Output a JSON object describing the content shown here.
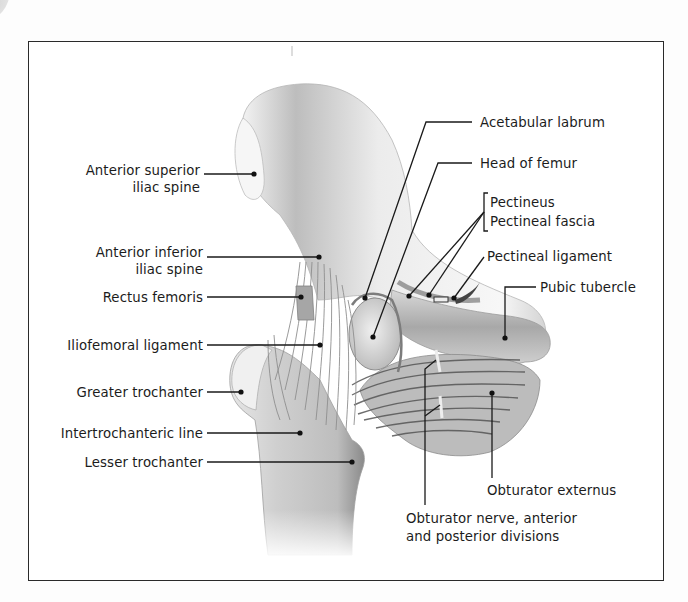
{
  "diagram": {
    "frame": {
      "x": 28,
      "y": 41,
      "width": 636,
      "height": 540
    },
    "colors": {
      "frame": "#2a2a2a",
      "text": "#1c1c1c",
      "leader": "#1a1a1a",
      "bone_light": "#f2f2f2",
      "bone_mid": "#c9c9c9",
      "bone_dark": "#8e8e8e",
      "ligament": "#a9a9a9",
      "muscle": "#7d7d7d"
    },
    "labels_left": [
      {
        "id": "anterior-superior-iliac-spine",
        "lines": [
          "Anterior superior",
          "iliac spine"
        ],
        "x_right": 200,
        "y": 162,
        "point": [
          254,
          174
        ]
      },
      {
        "id": "anterior-inferior-iliac-spine",
        "lines": [
          "Anterior inferior",
          "iliac spine"
        ],
        "x_right": 203,
        "y": 244,
        "point": [
          319,
          257
        ]
      },
      {
        "id": "rectus-femoris",
        "lines": [
          "Rectus femoris"
        ],
        "x_right": 203,
        "y": 289,
        "point": [
          301,
          297
        ]
      },
      {
        "id": "iliofemoral-ligament",
        "lines": [
          "Iliofemoral ligament"
        ],
        "x_right": 203,
        "y": 337,
        "point": [
          320,
          345
        ]
      },
      {
        "id": "greater-trochanter",
        "lines": [
          "Greater trochanter"
        ],
        "x_right": 203,
        "y": 384,
        "point": [
          241,
          392
        ]
      },
      {
        "id": "intertrochanteric-line",
        "lines": [
          "Intertrochanteric line"
        ],
        "x_right": 203,
        "y": 425,
        "point": [
          300,
          433
        ]
      },
      {
        "id": "lesser-trochanter",
        "lines": [
          "Lesser trochanter"
        ],
        "x_right": 203,
        "y": 454,
        "point": [
          352,
          462
        ]
      }
    ],
    "labels_right": [
      {
        "id": "acetabular-labrum",
        "lines": [
          "Acetabular labrum"
        ],
        "x": 480,
        "y": 114
      },
      {
        "id": "head-of-femur",
        "lines": [
          "Head of femur"
        ],
        "x": 480,
        "y": 155
      },
      {
        "id": "pectineus-group",
        "lines": [
          "Pectineus",
          "Pectineal fascia"
        ],
        "x": 490,
        "y": 193
      },
      {
        "id": "pectineal-ligament",
        "lines": [
          "Pectineal ligament"
        ],
        "x": 487,
        "y": 248
      },
      {
        "id": "pubic-tubercle",
        "lines": [
          "Pubic tubercle"
        ],
        "x": 540,
        "y": 279
      },
      {
        "id": "obturator-externus",
        "lines": [
          "Obturator externus"
        ],
        "x": 487,
        "y": 482
      },
      {
        "id": "obturator-nerve",
        "lines": [
          "Obturator nerve, anterior",
          "and posterior divisions"
        ],
        "x": 406,
        "y": 510
      }
    ]
  }
}
